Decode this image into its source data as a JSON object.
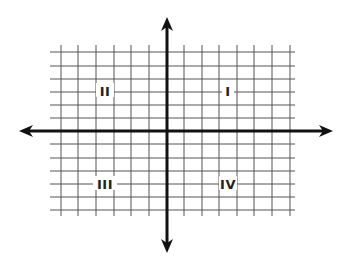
{
  "diagram": {
    "type": "coordinate-plane",
    "colors": {
      "background": "#ffffff",
      "grid": "#555555",
      "axis": "#111111",
      "label": "#222222"
    },
    "grid": {
      "vertical_lines_x": [
        61,
        78,
        96,
        114,
        131,
        149,
        184,
        202,
        219,
        237,
        254,
        272,
        290
      ],
      "horizontal_lines_y": [
        52,
        66,
        79,
        92,
        105,
        118,
        144,
        158,
        171,
        184,
        197,
        210
      ],
      "x_extent": [
        50,
        295
      ],
      "y_extent": [
        45,
        216
      ]
    },
    "axes": {
      "origin": [
        167,
        131
      ],
      "x_axis": {
        "from": 19,
        "to": 333,
        "y": 131,
        "arrows": "both"
      },
      "y_axis": {
        "from": 17,
        "to": 253,
        "x": 167,
        "arrows": "both"
      }
    },
    "quadrants": [
      {
        "id": "I",
        "label": "I",
        "x": 228,
        "y": 91
      },
      {
        "id": "II",
        "label": "II",
        "x": 105,
        "y": 91
      },
      {
        "id": "III",
        "label": "III",
        "x": 105,
        "y": 184
      },
      {
        "id": "IV",
        "label": "IV",
        "x": 228,
        "y": 184
      }
    ]
  }
}
